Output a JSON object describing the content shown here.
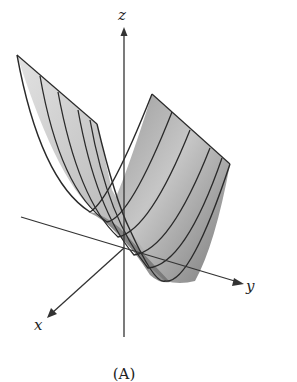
{
  "figure": {
    "caption": "(A)",
    "axes": {
      "x_label": "x",
      "y_label": "y",
      "z_label": "z"
    },
    "surface": "parabolic cylinder (z = y^2 style trough) with 4 cross-section curves",
    "colors": {
      "axis": "#333333",
      "surface_light": "#d8d8d8",
      "surface_dark": "#6a6a6a",
      "edge": "#2a2a2a"
    }
  }
}
